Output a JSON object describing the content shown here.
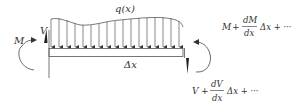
{
  "diagram": {
    "type": "beam-free-body-element",
    "labels": {
      "load": "q(x)",
      "left_moment": "M",
      "left_shear": "V",
      "length": "Δx",
      "right_moment_M": "M",
      "right_moment_plus": "+",
      "right_moment_num": "dM",
      "right_moment_den": "dx",
      "right_moment_tail": "Δx + ···",
      "right_shear_V": "V",
      "right_shear_plus": "+",
      "right_shear_num": "dV",
      "right_shear_den": "dx",
      "right_shear_tail": "Δx + ···"
    },
    "colors": {
      "stroke": "#444444",
      "text": "#333333",
      "background": "#ffffff"
    },
    "load_arrow_count": 17
  }
}
